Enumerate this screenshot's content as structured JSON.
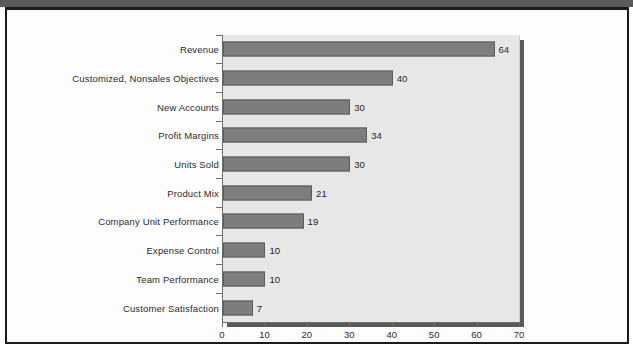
{
  "figure": {
    "background_color": "#ffffff",
    "frame_color": "#1a1a1a",
    "top_band_color": "#5b5b5b"
  },
  "chart_data": {
    "type": "bar",
    "orientation": "horizontal",
    "title": "",
    "subtitle": "",
    "xlabel": "",
    "ylabel": "",
    "xlim": [
      0,
      70
    ],
    "ylim": null,
    "grid": false,
    "legend": null,
    "bar_color": "#7d7d7d",
    "bar_edge_color": "#5d5d5d",
    "plot_background_color": "#e7e7e7",
    "xticks": [
      "0",
      "10",
      "20",
      "30",
      "40",
      "50",
      "60",
      "70"
    ],
    "xtick_values": [
      0,
      10,
      20,
      30,
      40,
      50,
      60,
      70
    ],
    "categories": [
      "Revenue",
      "Customized, Nonsales Objectives",
      "New Accounts",
      "Profit Margins",
      "Units Sold",
      "Product Mix",
      "Company Unit Performance",
      "Expense Control",
      "Team Performance",
      "Customer Satisfaction"
    ],
    "values": [
      64,
      40,
      30,
      34,
      30,
      21,
      19,
      10,
      10,
      7
    ],
    "value_labels": [
      "64",
      "40",
      "30",
      "34",
      "30",
      "21",
      "19",
      "10",
      "10",
      "7"
    ]
  }
}
